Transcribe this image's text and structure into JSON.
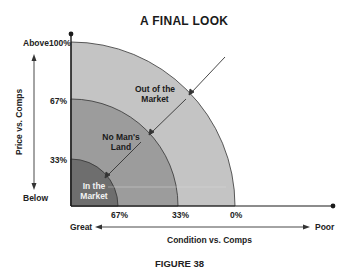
{
  "title": "A FINAL LOOK",
  "caption": "FIGURE 38",
  "y_axis": {
    "label": "Price vs. Comps",
    "top_label": "Above",
    "bottom_label": "Below",
    "ticks": [
      "100%",
      "67%",
      "33%"
    ]
  },
  "x_axis": {
    "label": "Condition vs. Comps",
    "left_label": "Great",
    "right_label": "Poor",
    "ticks": [
      "67%",
      "33%",
      "0%"
    ]
  },
  "regions": [
    {
      "name": "In the Market",
      "line1": "In the",
      "line2": "Market",
      "color": "#6e6e6e"
    },
    {
      "name": "No Man's Land",
      "line1": "No Man's",
      "line2": "Land",
      "color": "#9a9a9a"
    },
    {
      "name": "Out of the Market",
      "line1": "Out of the",
      "line2": "Market",
      "color": "#c4c4c4"
    }
  ],
  "colors": {
    "axis": "#1a1a1a",
    "arc_stroke": "#333333",
    "arrow": "#333333",
    "text": "#1a1a1a"
  }
}
